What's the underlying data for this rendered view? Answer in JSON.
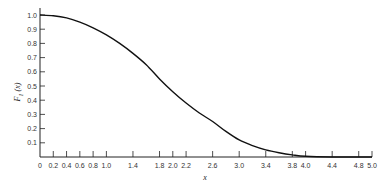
{
  "chart_data": {
    "type": "line",
    "title": "",
    "xlabel": "x",
    "ylabel": "F1(x)",
    "ylabel_main": "F",
    "ylabel_sub": "1",
    "ylabel_arg": "(x)",
    "xlim": [
      0,
      5.0
    ],
    "ylim": [
      0,
      1.0
    ],
    "grid": false,
    "legend": null,
    "x_ticks": [
      "0",
      "0.2",
      "0.4",
      "0.6",
      "0.8",
      "1.0",
      "1.4",
      "1.8",
      "2.0",
      "2.2",
      "2.6",
      "3.0",
      "3.4",
      "3.8",
      "4.0",
      "4.4",
      "4.8",
      "5.0"
    ],
    "x_tick_values": [
      0,
      0.2,
      0.4,
      0.6,
      0.8,
      1.0,
      1.4,
      1.8,
      2.0,
      2.2,
      2.6,
      3.0,
      3.4,
      3.8,
      4.0,
      4.4,
      4.8,
      5.0
    ],
    "y_ticks": [
      "0.1",
      "0.2",
      "0.3",
      "0.4",
      "0.5",
      "0.6",
      "0.7",
      "0.8",
      "0.9",
      "1.0"
    ],
    "y_tick_values": [
      0.1,
      0.2,
      0.3,
      0.4,
      0.5,
      0.6,
      0.7,
      0.8,
      0.9,
      1.0
    ],
    "series": [
      {
        "name": "F1(x)",
        "x": [
          0,
          0.2,
          0.4,
          0.6,
          0.8,
          1.0,
          1.2,
          1.4,
          1.6,
          1.8,
          2.0,
          2.2,
          2.4,
          2.6,
          2.8,
          3.0,
          3.2,
          3.4,
          3.6,
          3.8,
          4.0,
          4.4,
          4.8,
          5.0
        ],
        "values": [
          1.0,
          0.995,
          0.98,
          0.95,
          0.91,
          0.86,
          0.8,
          0.73,
          0.65,
          0.55,
          0.46,
          0.38,
          0.31,
          0.25,
          0.18,
          0.12,
          0.08,
          0.05,
          0.03,
          0.015,
          0.005,
          0.0,
          0.0,
          0.0
        ]
      }
    ]
  }
}
